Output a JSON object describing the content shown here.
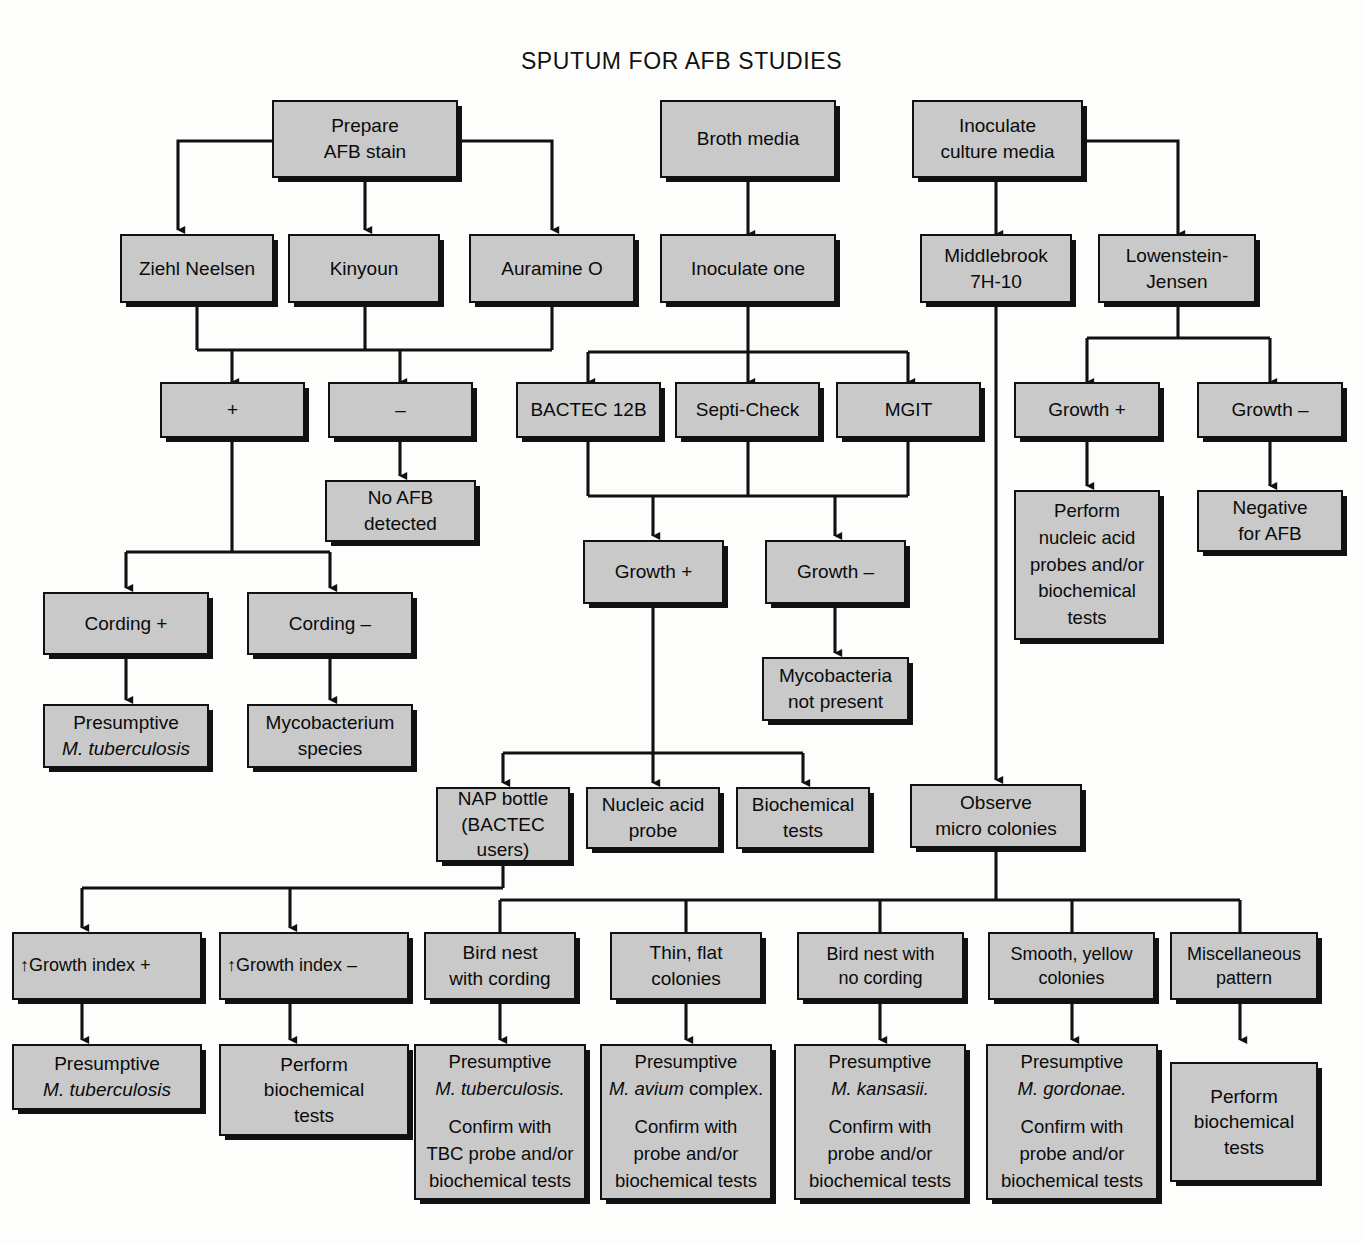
{
  "title": "SPUTUM FOR AFB STUDIES",
  "colors": {
    "node_fill": "#c9c9c9",
    "node_border": "#111111",
    "page_bg": "#fdfdfb",
    "text": "#0b0b0b"
  },
  "nodes": {
    "prepare_afb_stain": "Prepare\nAFB stain",
    "prepare_afb_stain_l1": "Prepare",
    "prepare_afb_stain_l2": "AFB stain",
    "broth_media": "Broth media",
    "inoculate_culture_media_l1": "Inoculate",
    "inoculate_culture_media_l2": "culture media",
    "ziehl_neelsen": "Ziehl Neelsen",
    "kinyoun": "Kinyoun",
    "auramine_o": "Auramine O",
    "inoculate_one": "Inoculate one",
    "middlebrook_l1": "Middlebrook",
    "middlebrook_l2": "7H-10",
    "lowenstein_l1": "Lowenstein-",
    "lowenstein_l2": "Jensen",
    "smear_positive": "+",
    "smear_negative": "–",
    "bactec_12b": "BACTEC 12B",
    "septi_check": "Septi-Check",
    "mgit": "MGIT",
    "lj_growth_positive": "Growth +",
    "lj_growth_negative": "Growth –",
    "no_afb_detected_l1": "No AFB",
    "no_afb_detected_l2": "detected",
    "perform_nap_l1": "Perform",
    "perform_nap_l2": "nucleic acid",
    "perform_nap_l3": "probes and/or",
    "perform_nap_l4": "biochemical",
    "perform_nap_l5": "tests",
    "negative_for_afb_l1": "Negative",
    "negative_for_afb_l2": "for AFB",
    "cording_positive": "Cording  +",
    "cording_negative": "Cording  –",
    "broth_growth_positive": "Growth +",
    "broth_growth_negative": "Growth  –",
    "presumptive_mtb_cording_l1": "Presumptive",
    "presumptive_mtb_cording_l2": "M. tuberculosis",
    "mycobacterium_species_l1": "Mycobacterium",
    "mycobacterium_species_l2": "species",
    "mycobacteria_absent_l1": "Mycobacteria",
    "mycobacteria_absent_l2": "not present",
    "nap_bottle_l1": "NAP bottle",
    "nap_bottle_l2": "(BACTEC",
    "nap_bottle_l3": "users)",
    "nucleic_acid_probe_l1": "Nucleic acid",
    "nucleic_acid_probe_l2": "probe",
    "biochemical_tests_l1": "Biochemical",
    "biochemical_tests_l2": "tests",
    "observe_micro_colonies_l1": "Observe",
    "observe_micro_colonies_l2": "micro colonies",
    "growth_index_positive": "↑Growth index +",
    "growth_index_negative": "↑Growth index –",
    "bird_nest_cording_l1": "Bird nest",
    "bird_nest_cording_l2": "with cording",
    "thin_flat_l1": "Thin, flat",
    "thin_flat_l2": "colonies",
    "bird_nest_no_cording_l1": "Bird nest with",
    "bird_nest_no_cording_l2": "no cording",
    "smooth_yellow_l1": "Smooth, yellow",
    "smooth_yellow_l2": "colonies",
    "miscellaneous_l1": "Miscellaneous",
    "miscellaneous_l2": "pattern",
    "final_mtb_l1": "Presumptive",
    "final_mtb_l2": "M. tuberculosis",
    "perform_biochem_l1": "Perform",
    "perform_biochem_l2": "biochemical",
    "perform_biochem_l3": "tests",
    "res_tbc_l1": "Presumptive",
    "res_tbc_l2": "M. tuberculosis.",
    "res_tbc_l3": "Confirm with",
    "res_tbc_l4": "TBC probe and/or",
    "res_tbc_l5": "biochemical tests",
    "res_avium_l1": "Presumptive",
    "res_avium_l2a": "M. avium",
    "res_avium_l2b": " complex.",
    "res_avium_l3": "Confirm with",
    "res_avium_l4": "probe and/or",
    "res_avium_l5": "biochemical tests",
    "res_kansasii_l1": "Presumptive",
    "res_kansasii_l2": "M. kansasii.",
    "res_kansasii_l3": "Confirm with",
    "res_kansasii_l4": "probe and/or",
    "res_kansasii_l5": "biochemical tests",
    "res_gordonae_l1": "Presumptive",
    "res_gordonae_l2": "M. gordonae.",
    "res_gordonae_l3": "Confirm with",
    "res_gordonae_l4": "probe and/or",
    "res_gordonae_l5": "biochemical tests",
    "res_misc_l1": "Perform",
    "res_misc_l2": "biochemical",
    "res_misc_l3": "tests"
  }
}
